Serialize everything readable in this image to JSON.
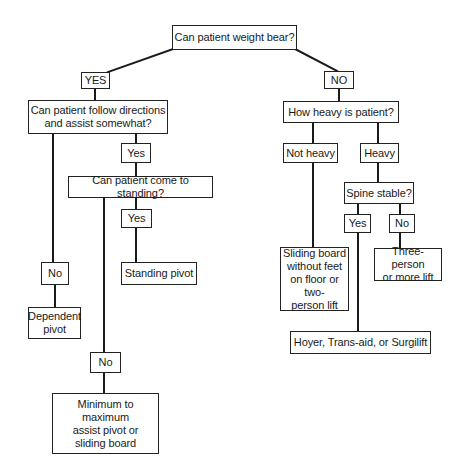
{
  "diagram": {
    "type": "decision-tree",
    "nodes": {
      "root": {
        "label": "Can patient weight bear?"
      },
      "yes_top": {
        "label": "YES"
      },
      "no_top": {
        "label": "NO"
      },
      "follow_directions": {
        "label": "Can patient follow directions\nand assist somewhat?"
      },
      "follow_yes": {
        "label": "Yes"
      },
      "follow_no": {
        "label": "No"
      },
      "dependent_pivot": {
        "label": "Dependent\npivot"
      },
      "come_to_standing": {
        "label": "Can patient come to standing?"
      },
      "standing_yes": {
        "label": "Yes"
      },
      "standing_pivot": {
        "label": "Standing pivot"
      },
      "standing_no": {
        "label": "No"
      },
      "min_max_assist": {
        "label": "Minimum to maximum\nassist pivot or\nsliding board"
      },
      "how_heavy": {
        "label": "How heavy is patient?"
      },
      "not_heavy": {
        "label": "Not heavy"
      },
      "heavy": {
        "label": "Heavy"
      },
      "sliding_board": {
        "label": "Sliding board\nwithout feet\non floor or two-\nperson lift"
      },
      "spine_stable": {
        "label": "Spine stable?"
      },
      "spine_yes": {
        "label": "Yes"
      },
      "spine_no": {
        "label": "No"
      },
      "three_person": {
        "label": "Three-person\nor more lift"
      },
      "hoyer": {
        "label": "Hoyer, Trans-aid, or Surgilift"
      }
    },
    "edges": [
      [
        "root",
        "yes_top"
      ],
      [
        "root",
        "no_top"
      ],
      [
        "yes_top",
        "follow_directions"
      ],
      [
        "follow_directions",
        "follow_yes"
      ],
      [
        "follow_directions",
        "follow_no"
      ],
      [
        "follow_no",
        "dependent_pivot"
      ],
      [
        "follow_yes",
        "come_to_standing"
      ],
      [
        "come_to_standing",
        "standing_yes"
      ],
      [
        "standing_yes",
        "standing_pivot"
      ],
      [
        "come_to_standing",
        "standing_no"
      ],
      [
        "standing_no",
        "min_max_assist"
      ],
      [
        "no_top",
        "how_heavy"
      ],
      [
        "how_heavy",
        "not_heavy"
      ],
      [
        "how_heavy",
        "heavy"
      ],
      [
        "not_heavy",
        "sliding_board"
      ],
      [
        "heavy",
        "spine_stable"
      ],
      [
        "spine_stable",
        "spine_yes"
      ],
      [
        "spine_stable",
        "spine_no"
      ],
      [
        "spine_no",
        "three_person"
      ],
      [
        "spine_yes",
        "hoyer"
      ]
    ]
  }
}
